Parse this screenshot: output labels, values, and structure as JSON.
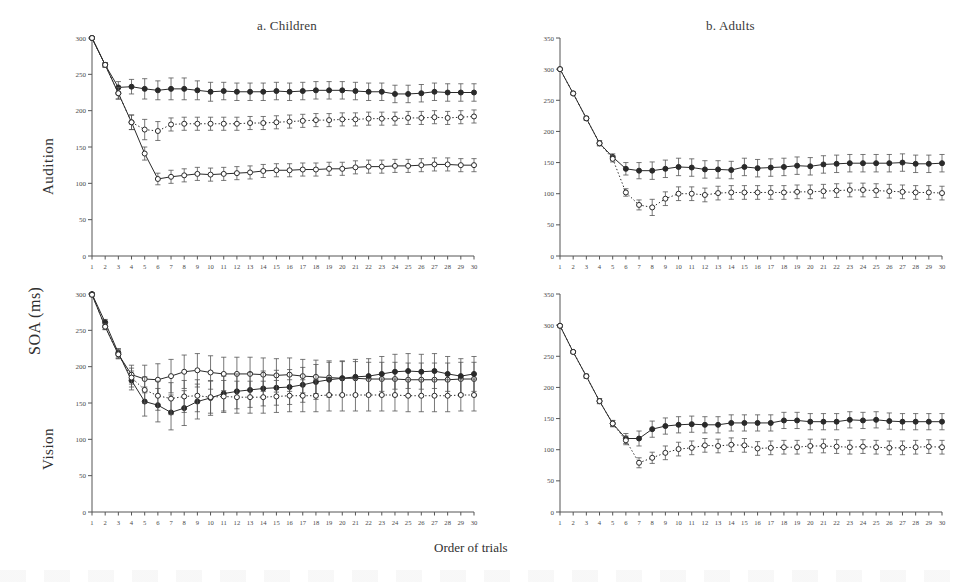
{
  "figure": {
    "ylabel": "SOA (ms)",
    "xlabel": "Order of trials",
    "row_labels": [
      "Audition",
      "Vision"
    ],
    "column_titles": [
      "a. Children",
      "b. Adults"
    ],
    "colors": {
      "ink": "#2a2a2a",
      "axis": "#555555",
      "open": "#ffffff"
    }
  },
  "chart_data": [
    {
      "id": "children-audition",
      "type": "line",
      "title": "a. Children",
      "row": "Audition",
      "xlabel": "Order of trials",
      "ylabel": "SOA (ms)",
      "xlim": [
        1,
        30
      ],
      "ylim": [
        0,
        300
      ],
      "yticks": [
        0,
        50,
        100,
        150,
        200,
        250,
        300
      ],
      "xticks": [
        1,
        2,
        3,
        4,
        5,
        6,
        7,
        8,
        9,
        10,
        11,
        12,
        13,
        14,
        15,
        16,
        17,
        18,
        19,
        20,
        21,
        22,
        23,
        24,
        25,
        26,
        27,
        28,
        29,
        30
      ],
      "grid": false,
      "legend": "none",
      "x": [
        1,
        2,
        3,
        4,
        5,
        6,
        7,
        8,
        9,
        10,
        11,
        12,
        13,
        14,
        15,
        16,
        17,
        18,
        19,
        20,
        21,
        22,
        23,
        24,
        25,
        26,
        27,
        28,
        29,
        30
      ],
      "series": [
        {
          "name": "filled-solid-upper",
          "marker": "filled-circle",
          "line": "solid",
          "values": [
            300,
            263,
            232,
            233,
            230,
            228,
            230,
            230,
            228,
            226,
            227,
            226,
            226,
            226,
            227,
            226,
            227,
            228,
            228,
            228,
            227,
            226,
            226,
            223,
            223,
            224,
            226,
            225,
            225,
            225
          ],
          "errors": [
            2,
            3,
            8,
            10,
            14,
            13,
            15,
            15,
            13,
            13,
            12,
            12,
            12,
            12,
            12,
            12,
            12,
            12,
            12,
            12,
            12,
            12,
            12,
            12,
            12,
            12,
            12,
            12,
            12,
            12
          ]
        },
        {
          "name": "open-dotted-middle",
          "marker": "open-circle",
          "line": "dotted",
          "values": [
            300,
            263,
            224,
            184,
            174,
            172,
            181,
            182,
            182,
            182,
            182,
            182,
            183,
            183,
            184,
            185,
            186,
            187,
            187,
            188,
            188,
            189,
            189,
            189,
            190,
            190,
            191,
            190,
            191,
            192
          ],
          "errors": [
            2,
            3,
            8,
            10,
            14,
            13,
            9,
            9,
            9,
            9,
            9,
            9,
            9,
            9,
            9,
            9,
            9,
            9,
            9,
            9,
            9,
            9,
            9,
            9,
            9,
            9,
            9,
            9,
            9,
            9
          ]
        },
        {
          "name": "open-solid-lower",
          "marker": "open-circle",
          "line": "solid",
          "values": [
            300,
            263,
            224,
            184,
            141,
            106,
            109,
            111,
            113,
            112,
            113,
            114,
            115,
            117,
            118,
            118,
            119,
            119,
            120,
            120,
            122,
            123,
            123,
            124,
            124,
            125,
            126,
            126,
            125,
            125
          ],
          "errors": [
            2,
            3,
            8,
            10,
            9,
            8,
            9,
            9,
            9,
            9,
            9,
            9,
            9,
            9,
            9,
            9,
            9,
            9,
            9,
            9,
            9,
            9,
            9,
            9,
            9,
            9,
            9,
            9,
            9,
            9
          ]
        }
      ]
    },
    {
      "id": "adults-audition",
      "type": "line",
      "title": "b. Adults",
      "row": "Audition",
      "xlabel": "Order of trials",
      "ylabel": "SOA (ms)",
      "xlim": [
        1,
        30
      ],
      "ylim": [
        0,
        350
      ],
      "yticks": [
        0,
        50,
        100,
        150,
        200,
        250,
        300,
        350
      ],
      "xticks": [
        1,
        2,
        3,
        4,
        5,
        6,
        7,
        8,
        9,
        10,
        11,
        12,
        13,
        14,
        15,
        16,
        17,
        18,
        19,
        20,
        21,
        22,
        23,
        24,
        25,
        26,
        27,
        28,
        29,
        30
      ],
      "grid": false,
      "legend": "none",
      "x": [
        1,
        2,
        3,
        4,
        5,
        6,
        7,
        8,
        9,
        10,
        11,
        12,
        13,
        14,
        15,
        16,
        17,
        18,
        19,
        20,
        21,
        22,
        23,
        24,
        25,
        26,
        27,
        28,
        29,
        30
      ],
      "series": [
        {
          "name": "filled-solid-upper",
          "marker": "filled-circle",
          "line": "solid",
          "values": [
            300,
            261,
            221,
            181,
            159,
            140,
            137,
            137,
            140,
            143,
            142,
            139,
            139,
            138,
            143,
            141,
            142,
            143,
            145,
            144,
            147,
            148,
            149,
            149,
            149,
            149,
            150,
            148,
            148,
            149
          ],
          "errors": [
            1,
            2,
            3,
            4,
            5,
            10,
            13,
            14,
            14,
            14,
            14,
            14,
            14,
            14,
            14,
            14,
            14,
            14,
            14,
            14,
            14,
            14,
            14,
            14,
            14,
            14,
            14,
            14,
            14,
            14
          ]
        },
        {
          "name": "open-dotted-lower",
          "marker": "open-circle",
          "line": "dotted",
          "values": [
            300,
            261,
            221,
            181,
            156,
            102,
            82,
            78,
            92,
            100,
            100,
            98,
            101,
            102,
            102,
            102,
            102,
            102,
            103,
            103,
            104,
            105,
            106,
            106,
            105,
            104,
            103,
            102,
            102,
            101
          ],
          "errors": [
            1,
            2,
            3,
            4,
            5,
            6,
            8,
            13,
            11,
            11,
            11,
            11,
            11,
            11,
            11,
            11,
            11,
            11,
            11,
            11,
            11,
            11,
            11,
            11,
            11,
            11,
            11,
            11,
            11,
            11
          ]
        }
      ]
    },
    {
      "id": "children-vision",
      "type": "line",
      "title": "a. Children",
      "row": "Vision",
      "xlabel": "Order of trials",
      "ylabel": "SOA (ms)",
      "xlim": [
        1,
        30
      ],
      "ylim": [
        0,
        300
      ],
      "yticks": [
        0,
        50,
        100,
        150,
        200,
        250,
        300
      ],
      "xticks": [
        1,
        2,
        3,
        4,
        5,
        6,
        7,
        8,
        9,
        10,
        11,
        12,
        13,
        14,
        15,
        16,
        17,
        18,
        19,
        20,
        21,
        22,
        23,
        24,
        25,
        26,
        27,
        28,
        29,
        30
      ],
      "grid": false,
      "legend": "none",
      "x": [
        1,
        2,
        3,
        4,
        5,
        6,
        7,
        8,
        9,
        10,
        11,
        12,
        13,
        14,
        15,
        16,
        17,
        18,
        19,
        20,
        21,
        22,
        23,
        24,
        25,
        26,
        27,
        28,
        29,
        30
      ],
      "series": [
        {
          "name": "open-solid-upper",
          "marker": "open-circle",
          "line": "solid",
          "values": [
            299,
            255,
            217,
            189,
            183,
            182,
            187,
            193,
            195,
            192,
            190,
            190,
            190,
            189,
            188,
            189,
            187,
            186,
            185,
            184,
            184,
            183,
            183,
            183,
            182,
            182,
            182,
            182,
            183,
            183
          ],
          "errors": [
            2,
            4,
            6,
            13,
            19,
            22,
            23,
            23,
            23,
            23,
            23,
            23,
            23,
            23,
            23,
            23,
            23,
            23,
            23,
            23,
            23,
            23,
            23,
            23,
            23,
            23,
            23,
            23,
            23,
            23
          ]
        },
        {
          "name": "filled-solid-cross",
          "marker": "filled-circle",
          "line": "solid",
          "values": [
            300,
            261,
            219,
            181,
            152,
            147,
            137,
            143,
            152,
            157,
            163,
            166,
            168,
            170,
            171,
            172,
            175,
            179,
            182,
            184,
            186,
            187,
            190,
            193,
            194,
            193,
            194,
            190,
            187,
            190
          ],
          "errors": [
            2,
            4,
            6,
            13,
            20,
            23,
            24,
            24,
            24,
            24,
            24,
            24,
            24,
            24,
            24,
            24,
            24,
            24,
            24,
            24,
            24,
            24,
            24,
            24,
            24,
            24,
            24,
            24,
            24,
            24
          ]
        },
        {
          "name": "open-dotted-middle",
          "marker": "open-circle",
          "line": "dotted",
          "values": [
            299,
            255,
            217,
            185,
            168,
            160,
            156,
            159,
            160,
            158,
            159,
            158,
            158,
            158,
            159,
            160,
            160,
            160,
            161,
            161,
            161,
            161,
            161,
            161,
            160,
            160,
            160,
            160,
            161,
            161
          ],
          "errors": [
            2,
            4,
            6,
            13,
            18,
            20,
            22,
            22,
            22,
            22,
            22,
            22,
            22,
            22,
            22,
            22,
            22,
            22,
            22,
            22,
            22,
            22,
            22,
            22,
            22,
            22,
            22,
            22,
            22,
            22
          ]
        }
      ]
    },
    {
      "id": "adults-vision",
      "type": "line",
      "title": "b. Adults",
      "row": "Vision",
      "xlabel": "Order of trials",
      "ylabel": "SOA (ms)",
      "xlim": [
        1,
        30
      ],
      "ylim": [
        0,
        350
      ],
      "yticks": [
        0,
        50,
        100,
        150,
        200,
        250,
        300,
        350
      ],
      "xticks": [
        1,
        2,
        3,
        4,
        5,
        6,
        7,
        8,
        9,
        10,
        11,
        12,
        13,
        14,
        15,
        16,
        17,
        18,
        19,
        20,
        21,
        22,
        23,
        24,
        25,
        26,
        27,
        28,
        29,
        30
      ],
      "grid": false,
      "legend": "none",
      "x": [
        1,
        2,
        3,
        4,
        5,
        6,
        7,
        8,
        9,
        10,
        11,
        12,
        13,
        14,
        15,
        16,
        17,
        18,
        19,
        20,
        21,
        22,
        23,
        24,
        25,
        26,
        27,
        28,
        29,
        30
      ],
      "series": [
        {
          "name": "filled-solid-upper",
          "marker": "filled-circle",
          "line": "solid",
          "values": [
            299,
            257,
            218,
            178,
            142,
            118,
            118,
            133,
            138,
            140,
            141,
            140,
            140,
            143,
            143,
            143,
            143,
            147,
            147,
            145,
            145,
            145,
            148,
            147,
            148,
            146,
            145,
            145,
            145,
            145
          ],
          "errors": [
            2,
            2,
            3,
            4,
            5,
            8,
            12,
            13,
            13,
            13,
            13,
            13,
            13,
            13,
            13,
            13,
            13,
            13,
            13,
            13,
            13,
            13,
            13,
            13,
            13,
            13,
            13,
            13,
            13,
            13
          ]
        },
        {
          "name": "open-dotted-lower",
          "marker": "open-circle",
          "line": "dotted",
          "values": [
            299,
            257,
            218,
            178,
            142,
            115,
            79,
            87,
            95,
            101,
            103,
            107,
            106,
            108,
            107,
            102,
            103,
            104,
            104,
            106,
            106,
            105,
            104,
            105,
            104,
            103,
            103,
            104,
            105,
            104
          ],
          "errors": [
            2,
            2,
            3,
            4,
            5,
            7,
            8,
            9,
            11,
            11,
            11,
            11,
            11,
            11,
            11,
            11,
            11,
            11,
            11,
            11,
            11,
            11,
            11,
            11,
            11,
            11,
            11,
            11,
            11,
            11
          ]
        }
      ]
    }
  ]
}
